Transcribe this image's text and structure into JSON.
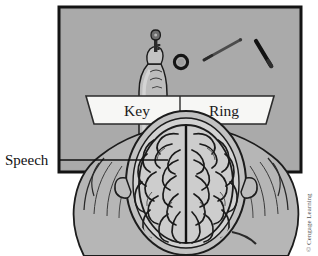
{
  "figure": {
    "type": "anatomical-diagram",
    "background_color": "#ffffff"
  },
  "screen": {
    "name": "projection-screen",
    "fill_color": "#a8a8a8",
    "border_color": "#1a1a1a",
    "x": 59,
    "y": 7,
    "width": 242,
    "height": 165
  },
  "banner": {
    "name": "word-banner",
    "fill_color": "#f7f7f5",
    "stroke_color": "#2b2b2b",
    "left_word": "Key",
    "right_word": "Ring",
    "divider": true
  },
  "callouts": [
    {
      "id": "speech",
      "label": "Speech",
      "leader_line": true,
      "points_to": "left-hemisphere"
    }
  ],
  "objects": [
    {
      "id": "hand-holding-key",
      "name": "hand-with-key",
      "description": "hand holding a key"
    },
    {
      "id": "ring",
      "name": "ring-object",
      "description": "small dark ring"
    },
    {
      "id": "pencil-gray",
      "name": "pencil-gray-object",
      "description": "thin gray rod"
    },
    {
      "id": "pencil-black",
      "name": "pencil-black-object",
      "description": "thick black rod"
    }
  ],
  "anatomy": {
    "head": "top-down view of head and shoulders",
    "brain": "cerebral cortex with gyri and sulci",
    "fissure": "longitudinal fissure",
    "skin_color": "#b9b9b9",
    "brain_color": "#cfcfcf",
    "outline_color": "#1c1c1c"
  },
  "credit": {
    "text": "© Cengage Learning",
    "orientation": "vertical"
  }
}
